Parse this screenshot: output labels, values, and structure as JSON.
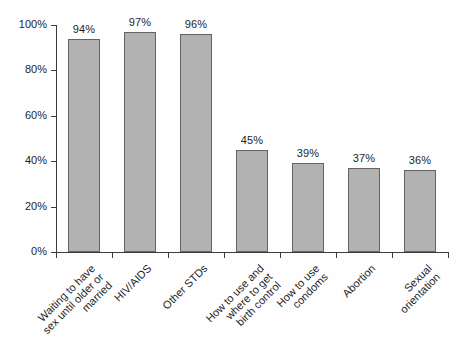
{
  "chart_data": {
    "type": "bar",
    "title": "",
    "xlabel": "",
    "ylabel": "",
    "ylim": [
      0,
      100
    ],
    "ytick_step": 20,
    "ytick_labels": [
      "0%",
      "20%",
      "40%",
      "60%",
      "80%",
      "100%"
    ],
    "grid": false,
    "legend": null,
    "categories": [
      "Waiting to have\nsex until older or\nmarried",
      "HIV/AIDS",
      "Other STDs",
      "How to use and\nwhere to get\nbirth control",
      "How to use\ncondoms",
      "Abortion",
      "Sexual\norientation"
    ],
    "values": [
      94,
      97,
      96,
      45,
      39,
      37,
      36
    ],
    "value_labels": [
      "94%",
      "97%",
      "96%",
      "45%",
      "39%",
      "37%",
      "36%"
    ],
    "colors": {
      "bar_fill": "#b2b2b2",
      "bar_border": "#636363",
      "axis": "#3c3c3c",
      "text": "#1f1f1f",
      "background": "#fefefe"
    }
  }
}
